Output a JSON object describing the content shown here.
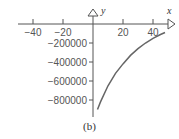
{
  "chart_data": {
    "type": "line",
    "title": "",
    "caption": "(b)",
    "xlabel": "x",
    "ylabel": "y",
    "x_ticks": [
      -40,
      -20,
      20,
      40
    ],
    "y_ticks": [
      -200000,
      -400000,
      -600000,
      -800000
    ],
    "x_tick_labels": [
      "−40",
      "−20",
      "20",
      "40"
    ],
    "y_tick_labels": [
      "−200000",
      "−400000",
      "−600000",
      "−800000"
    ],
    "xlim": [
      -50,
      50
    ],
    "ylim": [
      -900000,
      0
    ],
    "grid": false,
    "legend": null,
    "series": [
      {
        "name": "curve",
        "x": [
          3,
          5,
          10,
          15,
          20,
          25,
          30,
          35,
          40,
          45,
          48
        ],
        "y": [
          -900000,
          -820000,
          -650000,
          -520000,
          -420000,
          -330000,
          -260000,
          -200000,
          -150000,
          -110000,
          -90000
        ]
      }
    ],
    "colors": {
      "curve": "#666666",
      "axis": "#555555"
    }
  }
}
